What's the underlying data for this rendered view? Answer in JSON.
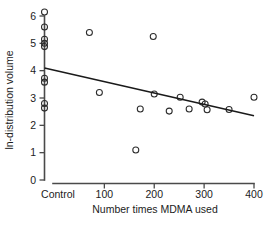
{
  "chart_data": {
    "type": "scatter",
    "title": "",
    "xlabel": "Number times MDMA used",
    "ylabel": "ln-distribution volume",
    "xlim": [
      -40,
      420
    ],
    "ylim": [
      0,
      6.4
    ],
    "grid": false,
    "legend": "none",
    "xticks": [
      {
        "value": -20,
        "label": "Control"
      },
      {
        "value": 100,
        "label": "100"
      },
      {
        "value": 200,
        "label": "200"
      },
      {
        "value": 300,
        "label": "300"
      },
      {
        "value": 400,
        "label": "400"
      }
    ],
    "yticks": [
      {
        "value": 0,
        "label": "0"
      },
      {
        "value": 1,
        "label": "1"
      },
      {
        "value": 2,
        "label": "2"
      },
      {
        "value": 3,
        "label": "3"
      },
      {
        "value": 4,
        "label": "4"
      },
      {
        "value": 5,
        "label": "5"
      },
      {
        "value": 6,
        "label": "6"
      }
    ],
    "series": [
      {
        "name": "Control",
        "marker": "open-circle",
        "points": [
          {
            "x": -20,
            "y": 6.15
          },
          {
            "x": -20,
            "y": 5.6
          },
          {
            "x": -20,
            "y": 5.15
          },
          {
            "x": -20,
            "y": 5.0
          },
          {
            "x": -20,
            "y": 4.88
          },
          {
            "x": -20,
            "y": 3.72
          },
          {
            "x": -20,
            "y": 3.58
          },
          {
            "x": -20,
            "y": 2.8
          },
          {
            "x": -20,
            "y": 2.63
          }
        ]
      },
      {
        "name": "MDMA users",
        "marker": "open-circle",
        "points": [
          {
            "x": 70,
            "y": 5.4
          },
          {
            "x": 90,
            "y": 3.2
          },
          {
            "x": 163,
            "y": 1.1
          },
          {
            "x": 172,
            "y": 2.6
          },
          {
            "x": 198,
            "y": 5.25
          },
          {
            "x": 200,
            "y": 3.15
          },
          {
            "x": 230,
            "y": 2.52
          },
          {
            "x": 252,
            "y": 3.03
          },
          {
            "x": 270,
            "y": 2.6
          },
          {
            "x": 296,
            "y": 2.85
          },
          {
            "x": 302,
            "y": 2.78
          },
          {
            "x": 306,
            "y": 2.57
          },
          {
            "x": 350,
            "y": 2.58
          },
          {
            "x": 400,
            "y": 3.03
          }
        ]
      }
    ],
    "trendline": {
      "name": "regression-line",
      "x0": -20,
      "y0": 4.1,
      "x1": 400,
      "y1": 2.35
    },
    "colors": {
      "marker_stroke": "#2b2b2b",
      "axis": "#4a4a4a",
      "trendline": "#1a1a1a",
      "background": "#ffffff"
    }
  }
}
